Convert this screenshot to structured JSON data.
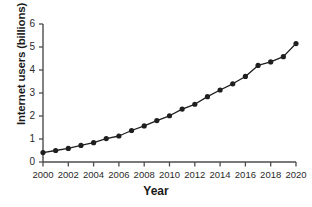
{
  "chart_data": {
    "type": "line",
    "title": "",
    "xlabel": "Year",
    "ylabel": "Internet users (billions)",
    "xlim": [
      2000,
      2020
    ],
    "ylim": [
      0,
      6
    ],
    "grid": false,
    "legend": "none",
    "marker": "filled-circle",
    "line_color": "#1f1f1f",
    "marker_color": "#1f1f1f",
    "axis_color": "#4d4d4d",
    "x": [
      2000,
      2001,
      2002,
      2003,
      2004,
      2005,
      2006,
      2007,
      2008,
      2009,
      2010,
      2011,
      2012,
      2013,
      2014,
      2015,
      2016,
      2017,
      2018,
      2019,
      2020
    ],
    "values": [
      0.41,
      0.5,
      0.59,
      0.72,
      0.84,
      1.02,
      1.13,
      1.37,
      1.57,
      1.8,
      2.01,
      2.3,
      2.51,
      2.84,
      3.13,
      3.4,
      3.72,
      4.2,
      4.35,
      4.58,
      5.15
    ],
    "series": [
      {
        "name": "Internet users",
        "values": [
          0.41,
          0.5,
          0.59,
          0.72,
          0.84,
          1.02,
          1.13,
          1.37,
          1.57,
          1.8,
          2.01,
          2.3,
          2.51,
          2.84,
          3.13,
          3.4,
          3.72,
          4.2,
          4.35,
          4.58,
          5.15
        ]
      }
    ],
    "y_ticks": [
      0,
      1,
      2,
      3,
      4,
      5,
      6
    ],
    "y_tick_labels": [
      "0",
      "1",
      "2",
      "3",
      "4",
      "5",
      "6"
    ],
    "x_ticks": [
      2000,
      2002,
      2004,
      2006,
      2008,
      2010,
      2012,
      2014,
      2016,
      2018,
      2020
    ],
    "x_tick_labels": [
      "2000",
      "2002",
      "2004",
      "2006",
      "2008",
      "2010",
      "2012",
      "2014",
      "2016",
      "2018",
      "2020"
    ]
  }
}
